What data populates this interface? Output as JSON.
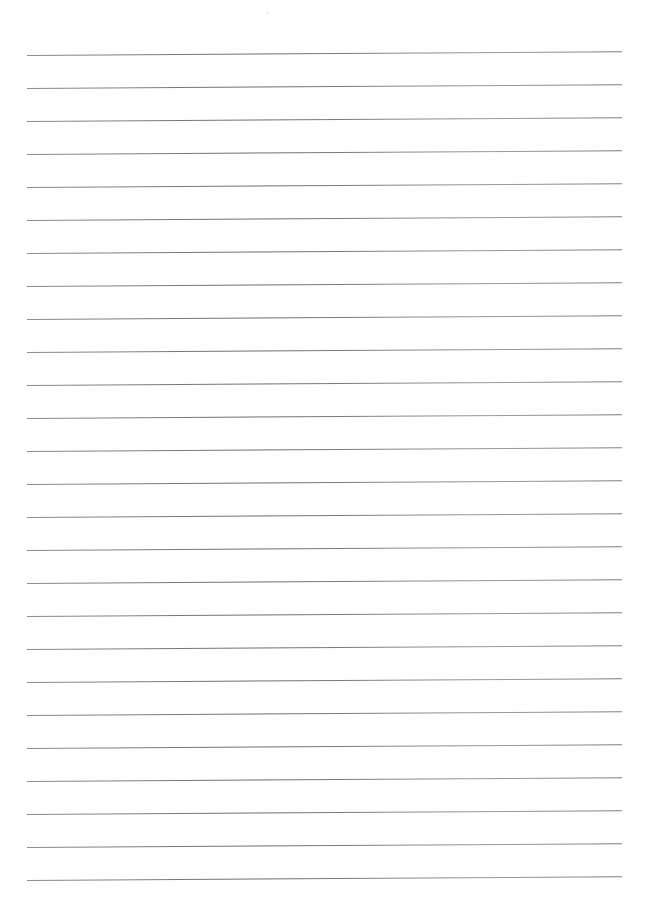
{
  "page": {
    "type": "lined-paper",
    "background_color": "#ffffff",
    "line_color": "#7a7a7a",
    "line_count": 26,
    "first_line_y": 55,
    "line_spacing": 33,
    "line_left_x": 27,
    "line_right_x": 622,
    "text": ""
  }
}
